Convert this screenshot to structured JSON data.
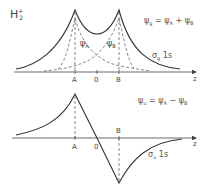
{
  "title": {
    "base": "H",
    "sub": "2",
    "sup": "+"
  },
  "top_panel": {
    "equation": {
      "lhs": "ψ",
      "lhs_sub": "g",
      "eq": " = ",
      "a": "ψ",
      "a_sub": "A",
      "op": " + ",
      "b": "ψ",
      "b_sub": "B"
    },
    "orbital_label": {
      "sigma": "σ",
      "sub": "g",
      "rest": " 1s"
    },
    "component_labels": [
      {
        "psi": "ψ",
        "sub": "A"
      },
      {
        "psi": "ψ",
        "sub": "B"
      }
    ],
    "axis_labels": {
      "a": "A",
      "origin": "0",
      "b": "B",
      "z": "z"
    }
  },
  "bottom_panel": {
    "equation": {
      "lhs": "ψ",
      "lhs_sub": "u",
      "eq": " = ",
      "a": "ψ",
      "a_sub": "A",
      "op": " − ",
      "b": "ψ",
      "b_sub": "B"
    },
    "orbital_label": {
      "sigma": "σ",
      "sub": "u",
      "rest": " 1s"
    },
    "axis_labels": {
      "a": "A",
      "origin": "0",
      "b": "B",
      "z": "z"
    }
  },
  "colors": {
    "line": "#333333",
    "dashed": "#555555",
    "axis": "#444444"
  }
}
